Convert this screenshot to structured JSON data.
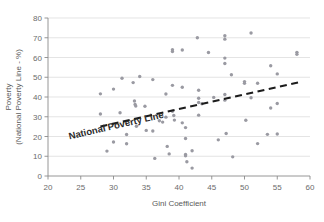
{
  "chart_data": {
    "type": "scatter",
    "title": "",
    "xlabel": "Gini Coefficient",
    "ylabel_line1": "Poverty",
    "ylabel_line2": "(National Poverty Line - %)",
    "xlim": [
      20,
      60
    ],
    "ylim": [
      0,
      80
    ],
    "xticks": [
      20,
      25,
      30,
      35,
      40,
      45,
      50,
      55,
      60
    ],
    "yticks": [
      0,
      10,
      20,
      30,
      40,
      50,
      60,
      70,
      80
    ],
    "grid": "horizontal",
    "legend": "none",
    "point_color": "#9a9aa2",
    "trendline_color": "#1c1c1c",
    "annotations": [
      {
        "text": "National Poverty Line",
        "x": 30.5,
        "y": 24,
        "rotation": -13
      }
    ],
    "trendline": {
      "style": "dashed",
      "x": [
        28.0,
        58.2
      ],
      "y": [
        25.0,
        47.4
      ]
    },
    "points": [
      {
        "x": 28.0,
        "y": 41.6
      },
      {
        "x": 28.0,
        "y": 31.4
      },
      {
        "x": 29.0,
        "y": 12.6
      },
      {
        "x": 30.0,
        "y": 44.0
      },
      {
        "x": 30.0,
        "y": 17.2
      },
      {
        "x": 31.0,
        "y": 32.0
      },
      {
        "x": 31.3,
        "y": 49.5
      },
      {
        "x": 32.0,
        "y": 21.0
      },
      {
        "x": 32.0,
        "y": 16.3
      },
      {
        "x": 33.0,
        "y": 47.3
      },
      {
        "x": 33.2,
        "y": 38.0
      },
      {
        "x": 33.3,
        "y": 36.2
      },
      {
        "x": 33.4,
        "y": 35.4
      },
      {
        "x": 33.5,
        "y": 25.2
      },
      {
        "x": 34.0,
        "y": 50.4
      },
      {
        "x": 34.8,
        "y": 35.3
      },
      {
        "x": 35.0,
        "y": 23.1
      },
      {
        "x": 36.0,
        "y": 48.8
      },
      {
        "x": 36.0,
        "y": 22.8
      },
      {
        "x": 36.3,
        "y": 8.9
      },
      {
        "x": 37.0,
        "y": 28.0
      },
      {
        "x": 37.5,
        "y": 27.3
      },
      {
        "x": 38.0,
        "y": 41.5
      },
      {
        "x": 38.0,
        "y": 29.8
      },
      {
        "x": 38.2,
        "y": 15.0
      },
      {
        "x": 38.5,
        "y": 11.2
      },
      {
        "x": 39.0,
        "y": 63.9
      },
      {
        "x": 39.0,
        "y": 63.0
      },
      {
        "x": 39.0,
        "y": 45.9
      },
      {
        "x": 39.0,
        "y": 32.8
      },
      {
        "x": 39.2,
        "y": 30.6
      },
      {
        "x": 39.3,
        "y": 28.3
      },
      {
        "x": 40.5,
        "y": 63.8
      },
      {
        "x": 40.5,
        "y": 44.9
      },
      {
        "x": 40.5,
        "y": 26.9
      },
      {
        "x": 41.0,
        "y": 24.5
      },
      {
        "x": 41.0,
        "y": 19.0
      },
      {
        "x": 41.0,
        "y": 10.9
      },
      {
        "x": 41.0,
        "y": 10.2
      },
      {
        "x": 41.2,
        "y": 7.2
      },
      {
        "x": 42.0,
        "y": 12.8
      },
      {
        "x": 42.0,
        "y": 4.0
      },
      {
        "x": 42.8,
        "y": 70.0
      },
      {
        "x": 43.0,
        "y": 43.4
      },
      {
        "x": 43.0,
        "y": 39.4
      },
      {
        "x": 43.0,
        "y": 37.2
      },
      {
        "x": 43.0,
        "y": 30.8
      },
      {
        "x": 43.5,
        "y": 36.6
      },
      {
        "x": 44.5,
        "y": 62.5
      },
      {
        "x": 45.3,
        "y": 39.8
      },
      {
        "x": 46.0,
        "y": 18.3
      },
      {
        "x": 47.0,
        "y": 71.0
      },
      {
        "x": 47.0,
        "y": 69.3
      },
      {
        "x": 47.0,
        "y": 59.7
      },
      {
        "x": 47.0,
        "y": 57.0
      },
      {
        "x": 47.0,
        "y": 41.3
      },
      {
        "x": 47.0,
        "y": 38.4
      },
      {
        "x": 47.2,
        "y": 21.5
      },
      {
        "x": 48.0,
        "y": 51.3
      },
      {
        "x": 48.2,
        "y": 9.7
      },
      {
        "x": 50.0,
        "y": 47.8
      },
      {
        "x": 50.0,
        "y": 46.9
      },
      {
        "x": 50.2,
        "y": 28.2
      },
      {
        "x": 51.0,
        "y": 72.4
      },
      {
        "x": 51.0,
        "y": 39.6
      },
      {
        "x": 52.0,
        "y": 47.0
      },
      {
        "x": 52.0,
        "y": 16.4
      },
      {
        "x": 53.5,
        "y": 21.1
      },
      {
        "x": 54.0,
        "y": 55.8
      },
      {
        "x": 54.0,
        "y": 34.4
      },
      {
        "x": 55.0,
        "y": 51.7
      },
      {
        "x": 55.0,
        "y": 36.7
      },
      {
        "x": 55.0,
        "y": 21.3
      },
      {
        "x": 58.0,
        "y": 62.6
      },
      {
        "x": 58.0,
        "y": 61.6
      }
    ]
  }
}
